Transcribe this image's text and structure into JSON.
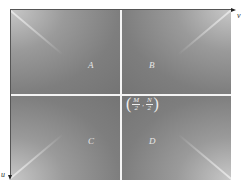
{
  "diagram": {
    "quadrants": [
      {
        "id": "A",
        "label": "A"
      },
      {
        "id": "B",
        "label": "B"
      },
      {
        "id": "C",
        "label": "C"
      },
      {
        "id": "D",
        "label": "D"
      }
    ],
    "center_point": {
      "open": "(",
      "x_num": "M",
      "x_den": "2",
      "sep": ",",
      "y_num": "N",
      "y_den": "2",
      "close": ")"
    },
    "axes": {
      "horizontal_label": "v",
      "vertical_label": "u"
    },
    "colors": {
      "background": "#7a7a7a",
      "divider": "#f4f4f4",
      "corner_highlight": "#c8c8c8"
    }
  }
}
